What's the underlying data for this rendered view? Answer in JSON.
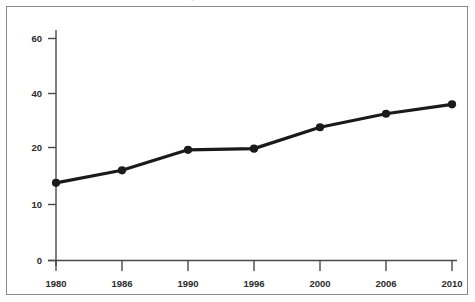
{
  "figure": {
    "top_caption_partial": "cut-off caption",
    "frame_color": "#8a8a8a",
    "background_color": "#ffffff"
  },
  "chart_data": {
    "type": "line",
    "title": "",
    "xlabel": "",
    "ylabel": "",
    "categories": [
      "1980",
      "1986",
      "1990",
      "1996",
      "2000",
      "2006",
      "2010"
    ],
    "values": [
      13.8,
      16.0,
      19.6,
      19.8,
      27.5,
      32.5,
      36.0
    ],
    "series": [
      {
        "name": "series-1",
        "values": [
          13.8,
          16.0,
          19.6,
          19.8,
          27.5,
          32.5,
          36.0
        ],
        "color": "#1a1a1a",
        "marker": "circle",
        "line_width": 3.2
      }
    ],
    "ytick_labels": [
      "0",
      "10",
      "20",
      "40",
      "60"
    ],
    "ytick_values": [
      0,
      10,
      20,
      40,
      60
    ],
    "ylim": [
      0,
      65
    ],
    "grid": false,
    "legend": false,
    "axis_color": "#4a4a4a",
    "note": "y-axis is irregularly spaced: equal pixel gaps between 0-10, 10-20, 20-40, 40-60"
  }
}
